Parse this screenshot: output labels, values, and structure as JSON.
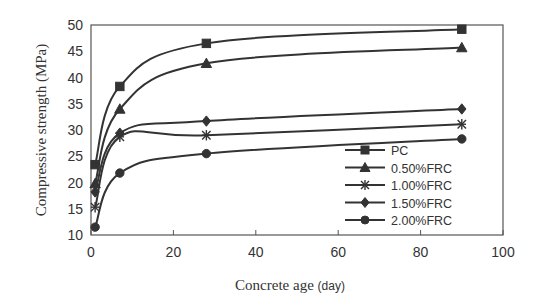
{
  "chart_data": {
    "type": "line",
    "title": "",
    "xlabel": "Concrete age (day)",
    "ylabel": "Compressive strength (MPa)",
    "xlim": [
      0,
      100
    ],
    "ylim": [
      10,
      50
    ],
    "x_ticks": [
      0,
      20,
      40,
      60,
      80,
      100
    ],
    "y_ticks": [
      10,
      15,
      20,
      25,
      30,
      35,
      40,
      45,
      50
    ],
    "grid": false,
    "legend_position": "lower right (inside plot)",
    "x": [
      1,
      7,
      28,
      90
    ],
    "series": [
      {
        "name": "PC",
        "marker": "square",
        "values": [
          23.4,
          38.3,
          46.5,
          49.2
        ]
      },
      {
        "name": "0.50%FRC",
        "marker": "triangle",
        "values": [
          19.8,
          34.0,
          42.7,
          45.7
        ]
      },
      {
        "name": "1.00%FRC",
        "marker": "asterisk",
        "values": [
          15.3,
          28.7,
          29.0,
          31.1
        ]
      },
      {
        "name": "1.50%FRC",
        "marker": "diamond",
        "values": [
          18.2,
          29.4,
          31.7,
          34.0
        ]
      },
      {
        "name": "2.00%FRC",
        "marker": "circle",
        "values": [
          11.5,
          21.8,
          25.5,
          28.3
        ]
      }
    ]
  },
  "labels": {
    "xlabel_main": "Concrete age ",
    "xlabel_unit": "(day)",
    "ylabel": "Compressive strength (MPa)"
  },
  "colors": {
    "line": "#333333",
    "axis": "#555555",
    "text": "#333333"
  }
}
